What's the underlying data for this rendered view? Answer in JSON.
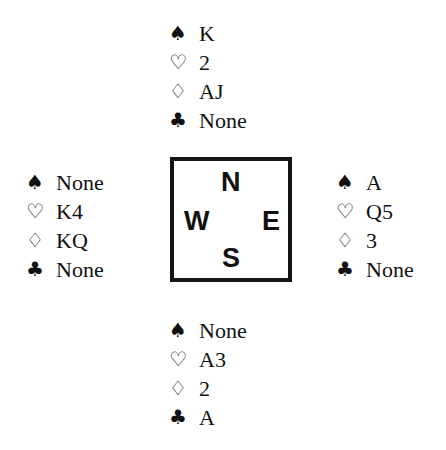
{
  "suits": {
    "spades": "♠",
    "hearts": "♡",
    "diamonds": "♢",
    "clubs": "♣"
  },
  "compass": {
    "north": "N",
    "west": "W",
    "east": "E",
    "south": "S"
  },
  "hands": {
    "north": {
      "spades": "K",
      "hearts": "2",
      "diamonds": "AJ",
      "clubs": "None"
    },
    "west": {
      "spades": "None",
      "hearts": "K4",
      "diamonds": "KQ",
      "clubs": "None"
    },
    "east": {
      "spades": "A",
      "hearts": "Q5",
      "diamonds": "3",
      "clubs": "None"
    },
    "south": {
      "spades": "None",
      "hearts": "A3",
      "diamonds": "2",
      "clubs": "A"
    }
  }
}
